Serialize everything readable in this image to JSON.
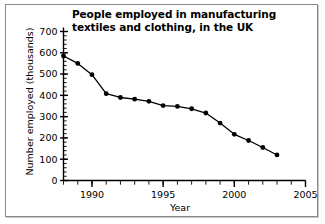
{
  "chart_data": {
    "type": "line",
    "title": "People employed in manufacturing textiles and clothing, in the UK",
    "title_line1": "People employed in manufacturing",
    "title_line2": "textiles and clothing, in the UK",
    "xlabel": "Year",
    "ylabel": "Number employed (thousands)",
    "xlim": [
      1988,
      2005
    ],
    "ylim": [
      0,
      700
    ],
    "xticks": [
      1990,
      1995,
      2000,
      2005
    ],
    "xtick_labels": [
      "1990",
      "1995",
      "2000",
      "2005"
    ],
    "x_minor_tick_step": 1,
    "yticks": [
      0,
      100,
      200,
      300,
      400,
      500,
      600,
      700
    ],
    "ytick_labels": [
      "0",
      "100",
      "200",
      "300",
      "400",
      "500",
      "600",
      "700"
    ],
    "y_minor_tick_step": 20,
    "grid": false,
    "legend": false,
    "line_color": "#000000",
    "marker": "circle",
    "marker_color": "#000000",
    "background_color": "#ffffff",
    "x": [
      1988,
      1989,
      1990,
      1991,
      1992,
      1993,
      1994,
      1995,
      1996,
      1997,
      1998,
      1999,
      2000,
      2001,
      2002,
      2003
    ],
    "values": [
      585,
      550,
      497,
      408,
      390,
      382,
      372,
      352,
      348,
      337,
      317,
      270,
      217,
      188,
      155,
      120
    ],
    "series": [
      {
        "name": "Number employed (thousands)",
        "values": [
          585,
          550,
          497,
          408,
          390,
          382,
          372,
          352,
          348,
          337,
          317,
          270,
          217,
          188,
          155,
          120
        ]
      }
    ]
  },
  "figure": {
    "frame_border_color": "#8a8a8a"
  }
}
